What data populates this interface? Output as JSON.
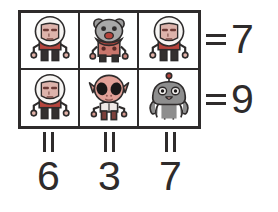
{
  "puzzle": {
    "type": "visual-arithmetic-grid",
    "grid": {
      "columns": 3,
      "rows": 2,
      "cells": [
        [
          {
            "character": "astronaut-red-suit",
            "value": 6
          },
          {
            "character": "gray-bear-alien-spotted-body",
            "value": 3
          },
          {
            "character": "astronaut-red-suit",
            "value": 6
          }
        ],
        [
          {
            "character": "astronaut-red-suit",
            "value": 6
          },
          {
            "character": "pink-big-eyed-alien",
            "value": 3
          },
          {
            "character": "gray-octopus-alien-antenna",
            "value": 7
          }
        ]
      ]
    },
    "row_sums": [
      {
        "equals_symbol": "=",
        "value": "7"
      },
      {
        "equals_symbol": "=",
        "value": "9"
      }
    ],
    "column_sums": [
      {
        "equals_symbol": "=",
        "value": "6"
      },
      {
        "equals_symbol": "=",
        "value": "3"
      },
      {
        "equals_symbol": "=",
        "value": "7"
      }
    ],
    "colors": {
      "outline": "#2e2b2b",
      "background": "#ffffff",
      "suit_red": "#b5443c",
      "skin_pink": "#e2a79c",
      "alien_gray": "#8e8e8e",
      "helmet_white": "#f2f0ee"
    }
  }
}
